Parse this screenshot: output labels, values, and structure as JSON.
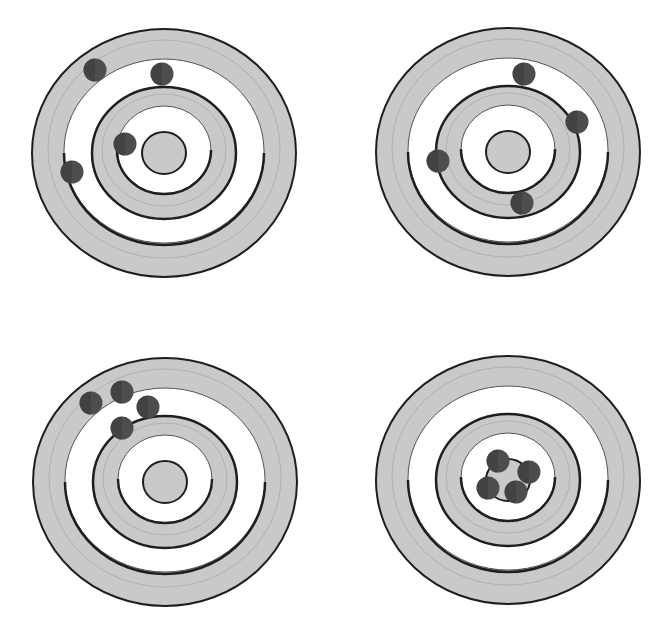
{
  "colors": {
    "background": "#ffffff",
    "ring_gray": "#c9c9c9",
    "ring_white": "#ffffff",
    "line_dark": "#1e1e1e",
    "line_thin": "#555555",
    "line_faint": "#b0b0b0",
    "dot": "#4d4d4d",
    "dot_dark": "#2e2e2e"
  },
  "ring_radii": {
    "outer": [
      132,
      124
    ],
    "white_band_outer": [
      100,
      92
    ],
    "inner_gray_outer": [
      72,
      66
    ],
    "inner_white_outer": [
      47,
      44
    ],
    "bullseye": [
      22,
      21
    ]
  },
  "dot_radius": 11.5,
  "targets": [
    {
      "id": "top-left",
      "center": [
        164,
        153
      ],
      "shots": [
        [
          95,
          70
        ],
        [
          162,
          74
        ],
        [
          125,
          144
        ],
        [
          72,
          172
        ]
      ]
    },
    {
      "id": "top-right",
      "center": [
        508,
        152
      ],
      "shots": [
        [
          524,
          74
        ],
        [
          577,
          122
        ],
        [
          438,
          161
        ],
        [
          522,
          203
        ]
      ]
    },
    {
      "id": "bottom-left",
      "center": [
        165,
        482
      ],
      "shots": [
        [
          91,
          403
        ],
        [
          122,
          392
        ],
        [
          148,
          407
        ],
        [
          122,
          428
        ]
      ]
    },
    {
      "id": "bottom-right",
      "center": [
        508,
        480
      ],
      "shots": [
        [
          498,
          461
        ],
        [
          529,
          472
        ],
        [
          488,
          488
        ],
        [
          516,
          492
        ]
      ]
    }
  ]
}
